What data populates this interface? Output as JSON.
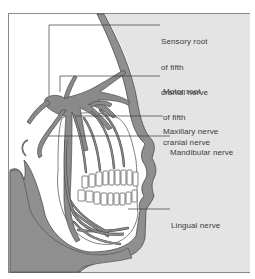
{
  "diagram": {
    "title": "",
    "labels": [
      {
        "id": "sensory-root",
        "lines": [
          "Sensory root",
          "of fifth",
          "cranial nerve"
        ]
      },
      {
        "id": "motor-root",
        "lines": [
          "Motor root",
          "of fifth",
          "cranial nerve"
        ]
      },
      {
        "id": "maxillary",
        "lines": [
          "Maxillary nerve"
        ]
      },
      {
        "id": "mandibular",
        "lines": [
          "Mandibular nerve"
        ]
      },
      {
        "id": "lingual",
        "lines": [
          "Lingual nerve"
        ]
      }
    ],
    "colors": {
      "tissue": "#8f8f8f",
      "background_light": "#e4e4e4",
      "nerve": "#8a8a8a",
      "outline": "#4a4a4a",
      "leader": "#3a3a3a",
      "text": "#3a3a3a"
    }
  }
}
